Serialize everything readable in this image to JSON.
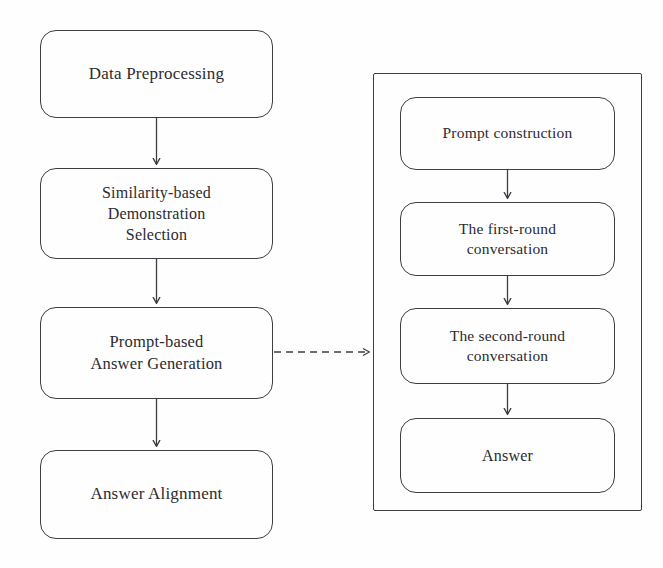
{
  "diagram": {
    "title": "",
    "colors": {
      "stroke": "#3d3d42",
      "text": "#2b2b30",
      "background": "#fefefe"
    },
    "left_flow": {
      "nodes": [
        {
          "id": "data-preprocessing",
          "label": "Data Preprocessing"
        },
        {
          "id": "similarity-based-demonstration-selection",
          "label": "Similarity-based\nDemonstration\nSelection"
        },
        {
          "id": "prompt-based-answer-generation",
          "label": "Prompt-based\nAnswer Generation"
        },
        {
          "id": "answer-alignment",
          "label": "Answer Alignment"
        }
      ]
    },
    "right_panel": {
      "label": "",
      "nodes": [
        {
          "id": "prompt-construction",
          "label": "Prompt construction"
        },
        {
          "id": "the-first-round-conversation",
          "label": "The first-round\nconversation"
        },
        {
          "id": "the-second-round-conversation",
          "label": "The second-round\nconversation"
        },
        {
          "id": "answer",
          "label": "Answer"
        }
      ]
    },
    "connectors": [
      {
        "id": "arrow-preprocessing-to-similarity",
        "style": "solid",
        "from": "data-preprocessing",
        "to": "similarity-based-demonstration-selection"
      },
      {
        "id": "arrow-similarity-to-generation",
        "style": "solid",
        "from": "similarity-based-demonstration-selection",
        "to": "prompt-based-answer-generation"
      },
      {
        "id": "arrow-generation-to-alignment",
        "style": "solid",
        "from": "prompt-based-answer-generation",
        "to": "answer-alignment"
      },
      {
        "id": "arrow-generation-to-panel",
        "style": "dashed",
        "from": "prompt-based-answer-generation",
        "to": "right-panel"
      },
      {
        "id": "arrow-construction-to-first-round",
        "style": "solid",
        "from": "prompt-construction",
        "to": "the-first-round-conversation"
      },
      {
        "id": "arrow-first-round-to-second-round",
        "style": "solid",
        "from": "the-first-round-conversation",
        "to": "the-second-round-conversation"
      },
      {
        "id": "arrow-second-round-to-answer",
        "style": "solid",
        "from": "the-second-round-conversation",
        "to": "answer"
      }
    ]
  }
}
